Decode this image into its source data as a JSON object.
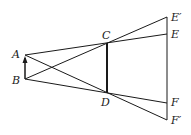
{
  "diagram": {
    "type": "geometric-ray-diagram",
    "colors": {
      "line": "#1a1a1a",
      "background": "#ffffff"
    },
    "points": {
      "A": {
        "label": "A",
        "x": 25,
        "y": 55
      },
      "B": {
        "label": "B",
        "x": 25,
        "y": 79
      },
      "C": {
        "label": "C",
        "x": 107,
        "y": 43
      },
      "D": {
        "label": "D",
        "x": 107,
        "y": 93
      },
      "E_prime": {
        "label": "E′",
        "x": 167,
        "y": 17
      },
      "E": {
        "label": "E",
        "x": 167,
        "y": 34
      },
      "F": {
        "label": "F",
        "x": 167,
        "y": 103
      },
      "F_prime": {
        "label": "F′",
        "x": 167,
        "y": 120
      }
    },
    "segments": [
      {
        "name": "A-E",
        "from": "A",
        "to": "E"
      },
      {
        "name": "B-E_prime",
        "from": "B",
        "to": "E_prime"
      },
      {
        "name": "B-F",
        "from": "B",
        "to": "F"
      },
      {
        "name": "A-F_prime",
        "from": "A",
        "to": "F_prime"
      },
      {
        "name": "C-D",
        "from": "C",
        "to": "D",
        "thick": true
      },
      {
        "name": "E_prime-F_prime",
        "from": "E_prime",
        "to": "F_prime"
      },
      {
        "name": "B-A-arrow",
        "from": "B",
        "to": "A",
        "arrow": true
      }
    ]
  }
}
